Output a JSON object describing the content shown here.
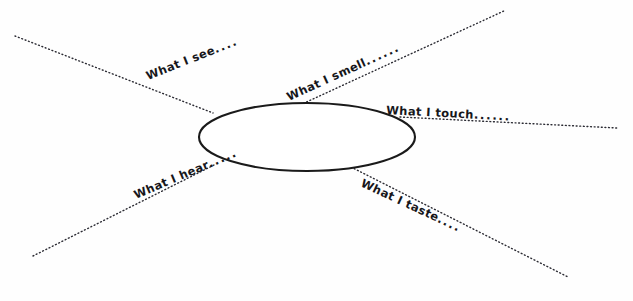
{
  "worksheet": {
    "title": "Five Senses Graphic Organizer",
    "center_label": "",
    "background_color": "#fefefe",
    "ink_color": "#16161a",
    "line_color": "#2b2b33",
    "ellipse": {
      "name": "center-topic-ellipse",
      "cx": 307,
      "cy": 137,
      "rx": 108,
      "ry": 34
    },
    "rays": [
      {
        "id": "see",
        "label": "What I see",
        "trailing_dots": "....",
        "x1": 15,
        "y1": 36,
        "x2": 213,
        "y2": 113,
        "label_x": 148,
        "label_y": 80,
        "rotation": -21.5
      },
      {
        "id": "smell",
        "label": "What I smell",
        "trailing_dots": "......",
        "x1": 287,
        "y1": 111,
        "x2": 506,
        "y2": 10,
        "label_x": 289,
        "label_y": 101,
        "rotation": -24.5
      },
      {
        "id": "touch",
        "label": "What I touch",
        "trailing_dots": "......",
        "x1": 400,
        "y1": 117,
        "x2": 617,
        "y2": 128,
        "label_x": 386,
        "label_y": 114,
        "rotation": 3.0
      },
      {
        "id": "hear",
        "label": "What I hear",
        "trailing_dots": ".....",
        "x1": 33,
        "y1": 256,
        "x2": 216,
        "y2": 164,
        "label_x": 136,
        "label_y": 199,
        "rotation": -23.0
      },
      {
        "id": "taste",
        "label": "What I taste",
        "trailing_dots": "....",
        "x1": 351,
        "y1": 167,
        "x2": 568,
        "y2": 277,
        "label_x": 360,
        "label_y": 186,
        "rotation": 25.0
      }
    ]
  }
}
